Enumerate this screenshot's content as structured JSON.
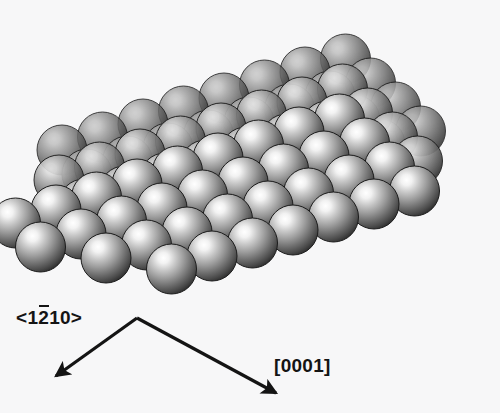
{
  "figure": {
    "kind": "space-filling-crystal-model",
    "background_color": "#f7f7f8",
    "width": 500,
    "height": 413
  },
  "labels": {
    "direction_a": {
      "full_text": "<1̅2̿10>",
      "prefix": "<1",
      "overbarred_digit": "2",
      "suffix": "10>",
      "points_to": "down-left"
    },
    "direction_c": {
      "full_text": "[0001]",
      "points_to": "down-right"
    }
  },
  "axes": {
    "line_color": "#141414",
    "line_width": 3.2,
    "vertex": {
      "x": 137,
      "y": 318
    },
    "arrow_a_tip": {
      "x": 56,
      "y": 376
    },
    "arrow_c_tip": {
      "x": 276,
      "y": 393
    }
  },
  "spheres": {
    "radius": 25,
    "highlight_color": "#fbfbfb",
    "mid_color": "#8e8e8e",
    "edge_color": "#2e2e2e",
    "rim_color": "#1c1c1c",
    "lattice": {
      "origin": {
        "x": 62,
        "y": 150
      },
      "vec_u": {
        "x": 40.5,
        "y": -13.0
      },
      "vec_v": {
        "x": 25.0,
        "y": 24.0
      },
      "vec_w": {
        "x": -3.0,
        "y": 30.0
      }
    },
    "layers": [
      {
        "name": "back-layer",
        "w": 0,
        "shade": 0.58,
        "cells": [
          [
            0,
            0
          ],
          [
            1,
            0
          ],
          [
            2,
            0
          ],
          [
            3,
            0
          ],
          [
            4,
            0
          ],
          [
            5,
            0
          ],
          [
            6,
            0
          ],
          [
            7,
            0
          ],
          [
            0,
            1
          ],
          [
            1,
            1
          ],
          [
            2,
            1
          ],
          [
            3,
            1
          ],
          [
            4,
            1
          ],
          [
            5,
            1
          ],
          [
            6,
            1
          ],
          [
            7,
            1
          ],
          [
            1,
            2
          ],
          [
            2,
            2
          ],
          [
            3,
            2
          ],
          [
            4,
            2
          ],
          [
            5,
            2
          ],
          [
            6,
            2
          ],
          [
            7,
            2
          ],
          [
            2,
            3
          ],
          [
            3,
            3
          ],
          [
            4,
            3
          ],
          [
            5,
            3
          ],
          [
            6,
            3
          ],
          [
            7,
            3
          ]
        ]
      },
      {
        "name": "middle-layer",
        "w": 1,
        "shade": 0.8,
        "cells": [
          [
            0,
            0
          ],
          [
            1,
            0
          ],
          [
            2,
            0
          ],
          [
            3,
            0
          ],
          [
            4,
            0
          ],
          [
            5,
            0
          ],
          [
            6,
            0
          ],
          [
            7,
            0
          ],
          [
            0,
            1
          ],
          [
            1,
            1
          ],
          [
            2,
            1
          ],
          [
            3,
            1
          ],
          [
            4,
            1
          ],
          [
            5,
            1
          ],
          [
            6,
            1
          ],
          [
            7,
            1
          ],
          [
            0,
            2
          ],
          [
            1,
            2
          ],
          [
            2,
            2
          ],
          [
            3,
            2
          ],
          [
            4,
            2
          ],
          [
            5,
            2
          ],
          [
            6,
            2
          ],
          [
            7,
            2
          ],
          [
            1,
            3
          ],
          [
            2,
            3
          ],
          [
            3,
            3
          ],
          [
            4,
            3
          ],
          [
            5,
            3
          ],
          [
            6,
            3
          ],
          [
            7,
            3
          ]
        ]
      },
      {
        "name": "front-layer",
        "w": 2,
        "shade": 1.0,
        "cells": [
          [
            -1,
            0
          ],
          [
            0,
            0
          ],
          [
            1,
            0
          ],
          [
            2,
            0
          ],
          [
            3,
            0
          ],
          [
            4,
            0
          ],
          [
            5,
            0
          ],
          [
            6,
            0
          ],
          [
            7,
            0
          ],
          [
            -1,
            1
          ],
          [
            0,
            1
          ],
          [
            1,
            1
          ],
          [
            2,
            1
          ],
          [
            3,
            1
          ],
          [
            4,
            1
          ],
          [
            5,
            1
          ],
          [
            6,
            1
          ],
          [
            7,
            1
          ],
          [
            0,
            2
          ],
          [
            1,
            2
          ],
          [
            2,
            2
          ],
          [
            3,
            2
          ],
          [
            4,
            2
          ],
          [
            5,
            2
          ],
          [
            6,
            2
          ],
          [
            7,
            2
          ],
          [
            1,
            3
          ],
          [
            2,
            3
          ],
          [
            3,
            3
          ],
          [
            4,
            3
          ],
          [
            5,
            3
          ],
          [
            6,
            3
          ],
          [
            7,
            3
          ]
        ]
      }
    ]
  }
}
